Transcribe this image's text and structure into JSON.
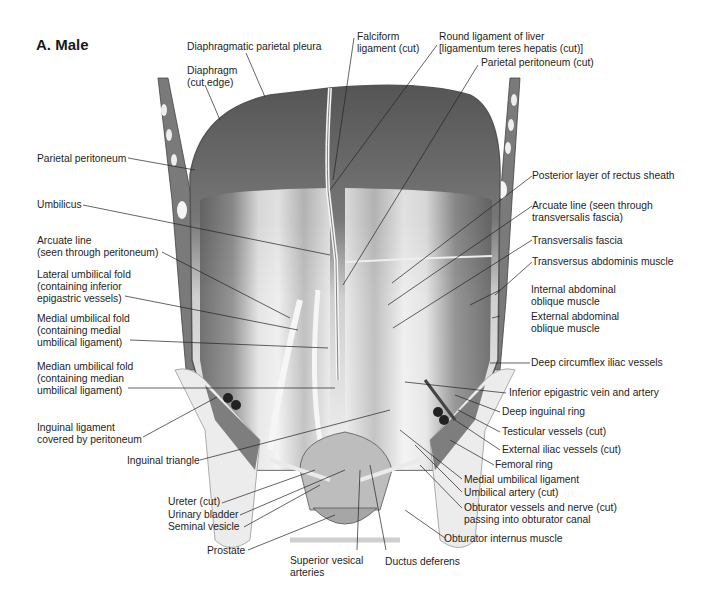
{
  "figure": {
    "title": "A. Male",
    "colors": {
      "background": "#ffffff",
      "wall_dark": "#6e6e6e",
      "wall_light": "#e6e6e6",
      "muscle": "#8a8a8a",
      "bone": "#ececec",
      "leader": "#222222"
    }
  },
  "labels": {
    "diaphragmatic_parietal_pleura": "Diaphragmatic parietal pleura",
    "diaphragm_cut_edge": "Diaphragm\n(cut edge)",
    "falciform_ligament": "Falciform\nligament (cut)",
    "round_ligament_liver": "Round ligament of liver\n[ligamentum teres hepatis (cut)]",
    "parietal_peritoneum_cut": "Parietal peritoneum (cut)",
    "parietal_peritoneum": "Parietal peritoneum",
    "umbilicus": "Umbilicus",
    "arcuate_line_peritoneum": "Arcuate line\n(seen through peritoneum)",
    "lateral_umbilical_fold": "Lateral umbilical fold\n(containing inferior\nepigastric vessels)",
    "medial_umbilical_fold": "Medial umbilical fold\n(containing medial\numbilical ligament)",
    "median_umbilical_fold": "Median umbilical fold\n(containing median\numbilical ligament)",
    "inguinal_ligament": "Inguinal ligament\ncovered by peritoneum",
    "inguinal_triangle": "Inguinal triangle",
    "ureter_cut": "Ureter (cut)",
    "urinary_bladder": "Urinary bladder",
    "seminal_vesicle": "Seminal vesicle",
    "prostate": "Prostate",
    "superior_vesical_arteries": "Superior vesical\narteries",
    "ductus_deferens": "Ductus deferens",
    "posterior_rectus_sheath": "Posterior layer of rectus sheath",
    "arcuate_line_transversalis": "Arcuate line (seen through\ntransversalis fascia)",
    "transversalis_fascia": "Transversalis fascia",
    "transversus_abdominis": "Transversus abdominis muscle",
    "internal_oblique": "Internal abdominal\noblique muscle",
    "external_oblique": "External abdominal\noblique muscle",
    "deep_circumflex_iliac": "Deep circumflex iliac vessels",
    "inferior_epigastric": "Inferior epigastric vein and artery",
    "deep_inguinal_ring": "Deep inguinal ring",
    "testicular_vessels": "Testicular vessels (cut)",
    "external_iliac_vessels": "External iliac vessels (cut)",
    "femoral_ring": "Femoral ring",
    "medial_umbilical_ligament": "Medial umbilical ligament",
    "umbilical_artery": "Umbilical artery (cut)",
    "obturator_vessels": "Obturator vessels and nerve (cut)\npassing into obturator canal",
    "obturator_internus": "Obturator internus muscle"
  }
}
